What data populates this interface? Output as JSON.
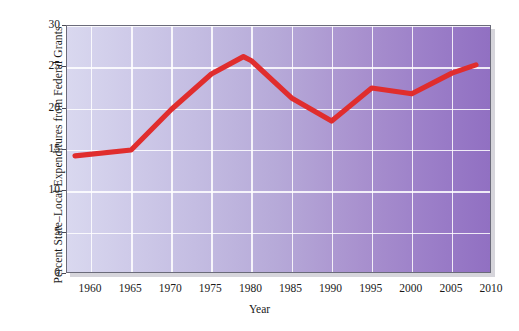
{
  "chart_data": {
    "type": "line",
    "title": "",
    "xlabel": "Year",
    "ylabel": "Percent State–Local Expenditures from Federal Grants",
    "xlim": [
      1957,
      2010
    ],
    "ylim": [
      0,
      30
    ],
    "xticks": [
      1960,
      1965,
      1970,
      1975,
      1980,
      1985,
      1990,
      1995,
      2000,
      2005,
      2010
    ],
    "yticks": [
      0,
      5,
      10,
      15,
      20,
      25,
      30
    ],
    "xtick_labels": [
      "1960",
      "1965",
      "1970",
      "1975",
      "1980",
      "1985",
      "1990",
      "1995",
      "2000",
      "2005",
      "2010"
    ],
    "ytick_labels": [
      "0",
      "5",
      "10",
      "15",
      "20",
      "25",
      "30"
    ],
    "grid": true,
    "legend": false,
    "series": [
      {
        "name": "Percent State–Local Expenditures from Federal Grants",
        "color": "#e02d2d",
        "x": [
          1958,
          1965,
          1970,
          1975,
          1979,
          1980,
          1985,
          1990,
          1995,
          2000,
          2005,
          2008
        ],
        "values": [
          14.3,
          15.0,
          19.9,
          24.2,
          26.3,
          25.8,
          21.3,
          18.5,
          22.5,
          21.8,
          24.3,
          25.3
        ]
      }
    ],
    "annotations": [],
    "plot_background": {
      "gradient_from": "#d9d8ef",
      "gradient_to": "#9170c2",
      "gridline_color": "#ffffff",
      "border_color": "#6b6b7a"
    }
  }
}
